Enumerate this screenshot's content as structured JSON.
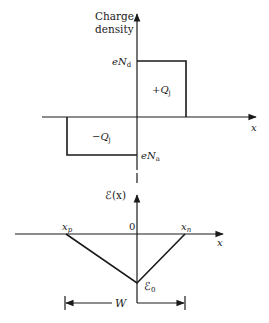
{
  "top_plot": {
    "y_axis_label_line1": "Charge",
    "y_axis_label_line2": "density",
    "x_axis_label": "x",
    "positive_level_label": "eN",
    "positive_level_sub": "d",
    "negative_level_label": "eN",
    "negative_level_sub": "a",
    "positive_charge_label": "+Q",
    "positive_charge_sub": "j",
    "negative_charge_label": "−Q",
    "negative_charge_sub": "j"
  },
  "bottom_plot": {
    "y_axis_label": "ℰ(x)",
    "x_axis_label": "x",
    "origin_label": "0",
    "xp_label": "x",
    "xp_sub": "p",
    "xn_label": "x",
    "xn_sub": "n",
    "peak_label": "ℰ",
    "peak_sub": "0",
    "width_label": "W"
  },
  "colors": {
    "line": "#1a1a1a",
    "background": "#ffffff"
  }
}
